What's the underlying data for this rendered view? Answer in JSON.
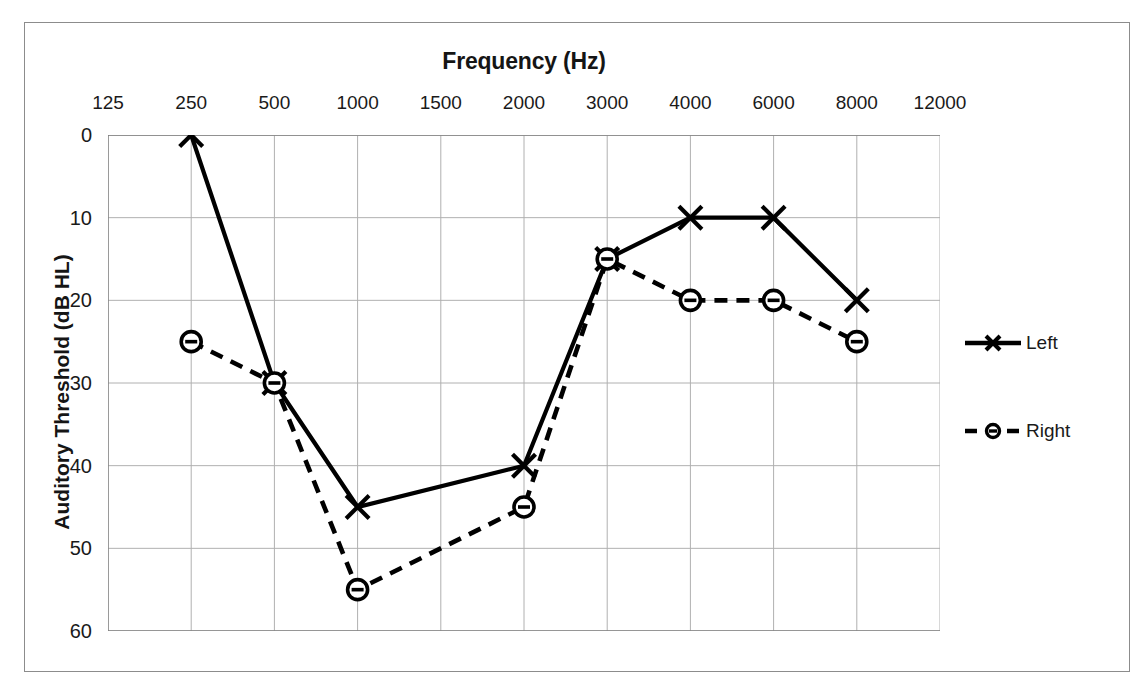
{
  "chart_data": {
    "type": "line",
    "title": "Frequency (Hz)",
    "xlabel": "Frequency (Hz)",
    "ylabel": "Auditory Threshold (dB HL)",
    "categories": [
      "125",
      "250",
      "500",
      "1000",
      "1500",
      "2000",
      "3000",
      "4000",
      "6000",
      "8000",
      "12000"
    ],
    "x_tick_labels": [
      "125",
      "250",
      "500",
      "1000",
      "1500",
      "2000",
      "3000",
      "4000",
      "6000",
      "8000",
      "12000"
    ],
    "y_tick_labels": [
      "0",
      "10",
      "20",
      "30",
      "40",
      "50",
      "60"
    ],
    "y_tick_values": [
      0,
      10,
      20,
      30,
      40,
      50,
      60
    ],
    "ylim": [
      0,
      60
    ],
    "y_axis_inverted": true,
    "grid": true,
    "x_axis_position": "top",
    "legend_position": "right",
    "series": [
      {
        "name": "Left",
        "line_style": "solid",
        "marker": "x",
        "color": "#000000",
        "points": [
          {
            "x": "250",
            "y": 0
          },
          {
            "x": "500",
            "y": 30
          },
          {
            "x": "1000",
            "y": 45
          },
          {
            "x": "2000",
            "y": 40
          },
          {
            "x": "3000",
            "y": 15
          },
          {
            "x": "4000",
            "y": 10
          },
          {
            "x": "6000",
            "y": 10
          },
          {
            "x": "8000",
            "y": 20
          }
        ]
      },
      {
        "name": "Right",
        "line_style": "dashed",
        "marker": "circle-dot",
        "color": "#000000",
        "points": [
          {
            "x": "250",
            "y": 25
          },
          {
            "x": "500",
            "y": 30
          },
          {
            "x": "1000",
            "y": 55
          },
          {
            "x": "2000",
            "y": 45
          },
          {
            "x": "3000",
            "y": 15
          },
          {
            "x": "4000",
            "y": 20
          },
          {
            "x": "6000",
            "y": 20
          },
          {
            "x": "8000",
            "y": 25
          }
        ]
      }
    ]
  },
  "legend": {
    "entries": [
      {
        "label": "Left"
      },
      {
        "label": "Right"
      }
    ]
  },
  "colors": {
    "line": "#000000",
    "grid": "#b0b0b0",
    "axis": "#808080",
    "frame": "#8c8c8c",
    "text": "#1a1a1a"
  }
}
